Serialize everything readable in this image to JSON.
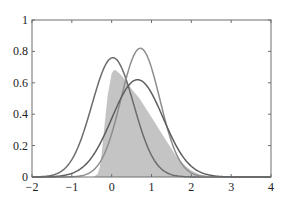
{
  "chart_data": {
    "type": "area",
    "title": "",
    "xlabel": "",
    "ylabel": "",
    "xlim": [
      -2,
      4
    ],
    "ylim": [
      0,
      1
    ],
    "grid": false,
    "legend": null,
    "x_ticks": [
      -2,
      -1,
      0,
      1,
      2,
      3,
      4
    ],
    "x_tick_labels": [
      "−2",
      "−1",
      "0",
      "1",
      "2",
      "3",
      "4"
    ],
    "y_ticks": [
      0,
      0.2,
      0.4,
      0.6,
      0.8,
      1
    ],
    "y_tick_labels": [
      "0",
      "0.2",
      "0.4",
      "0.6",
      "0.8",
      "1"
    ],
    "shaded_density": {
      "name": "target density (shaded)",
      "color": "#c4c4c4",
      "x": [
        -0.45,
        -0.35,
        -0.3,
        -0.25,
        -0.2,
        -0.1,
        0.0,
        0.05,
        0.1,
        0.2,
        0.3,
        0.4,
        0.5,
        0.6,
        0.7,
        0.8,
        0.9,
        1.0,
        1.1,
        1.2,
        1.3,
        1.4,
        1.5,
        1.6,
        1.7,
        1.8,
        1.9,
        2.0,
        2.1,
        2.2,
        2.3,
        2.4,
        2.5,
        2.6,
        2.7,
        2.8,
        3.0
      ],
      "values": [
        0.0,
        0.02,
        0.06,
        0.15,
        0.28,
        0.52,
        0.66,
        0.68,
        0.68,
        0.66,
        0.63,
        0.6,
        0.56,
        0.53,
        0.5,
        0.46,
        0.42,
        0.38,
        0.34,
        0.3,
        0.26,
        0.22,
        0.18,
        0.14,
        0.11,
        0.085,
        0.06,
        0.042,
        0.028,
        0.018,
        0.011,
        0.006,
        0.003,
        0.0015,
        0.0007,
        0.0003,
        0.0
      ]
    },
    "series": [
      {
        "name": "gaussian A",
        "color": "#6c6c6c",
        "mu": 0.03,
        "sigma": 0.525,
        "peak": 0.76
      },
      {
        "name": "gaussian B",
        "color": "#8e8e8e",
        "mu": 0.72,
        "sigma": 0.487,
        "peak": 0.82
      },
      {
        "name": "gaussian C",
        "color": "#5e5e5e",
        "mu": 0.65,
        "sigma": 0.643,
        "peak": 0.62
      }
    ]
  },
  "layout": {
    "plot_left": 32,
    "plot_right": 271,
    "plot_top": 20,
    "plot_bottom": 177
  }
}
